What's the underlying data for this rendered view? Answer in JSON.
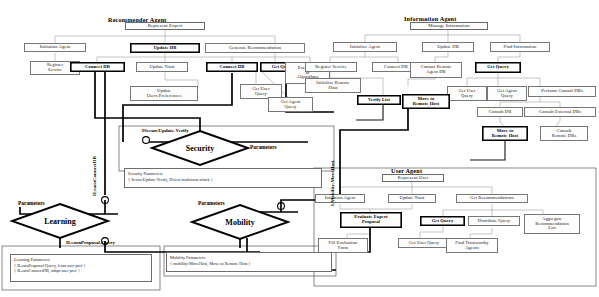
{
  "diagram": {
    "agents": [
      {
        "id": "recommender",
        "title": "Recommender Agent",
        "root": "Represent Expert",
        "nodes": [
          {
            "id": "rec-init",
            "label": "Initiation Agent",
            "style": "plain"
          },
          {
            "id": "rec-reg",
            "label": "Register\nService",
            "style": "plain"
          },
          {
            "id": "rec-upd",
            "label": "Update DB",
            "style": "bold"
          },
          {
            "id": "rec-conn",
            "label": "Connect DB",
            "style": "bold"
          },
          {
            "id": "rec-trust",
            "label": "Update Trust",
            "style": "plain"
          },
          {
            "id": "rec-pref",
            "label": "Update\nUsers Preferences",
            "style": "plain"
          },
          {
            "id": "rec-gen",
            "label": "Generate Recommendation",
            "style": "plain"
          },
          {
            "id": "rec-conn2",
            "label": "Connect DB",
            "style": "bold"
          },
          {
            "id": "rec-getq",
            "label": "Get Query",
            "style": "bold"
          },
          {
            "id": "rec-exec",
            "label": "Execution\nof\nAlgorithms",
            "style": "plain"
          },
          {
            "id": "rec-guq",
            "label": "Get User\nQuery",
            "style": "plain"
          },
          {
            "id": "rec-gaq",
            "label": "Get Agent\nQuery",
            "style": "plain"
          }
        ]
      },
      {
        "id": "information",
        "title": "Information Agent",
        "root": "Manage Information",
        "nodes": [
          {
            "id": "inf-init",
            "label": "Initialize Agent",
            "style": "plain"
          },
          {
            "id": "inf-reg",
            "label": "Register Service",
            "style": "plain"
          },
          {
            "id": "inf-conn",
            "label": "Connect DB",
            "style": "plain"
          },
          {
            "id": "inf-upd",
            "label": "Update DB",
            "style": "plain"
          },
          {
            "id": "inf-crdb",
            "label": "Contact Remote\nAgent DB",
            "style": "plain"
          },
          {
            "id": "inf-find",
            "label": "Find Information",
            "style": "plain"
          },
          {
            "id": "inf-getq",
            "label": "Get Query",
            "style": "bold"
          },
          {
            "id": "inf-guq",
            "label": "Get User\nQuery",
            "style": "plain"
          },
          {
            "id": "inf-gaq",
            "label": "Get Agent\nQuery",
            "style": "plain"
          },
          {
            "id": "inf-pcdb",
            "label": "Perform Consult DBs",
            "style": "plain"
          },
          {
            "id": "inf-cdb",
            "label": "Consult DB",
            "style": "plain"
          },
          {
            "id": "inf-cedb",
            "label": "Consult External DBs",
            "style": "plain"
          },
          {
            "id": "inf-crdbs",
            "label": "Consult\nRemote DBs",
            "style": "plain"
          },
          {
            "id": "inf-ver",
            "label": "Verify List",
            "style": "bold"
          },
          {
            "id": "inf-move1",
            "label": "Move to\nRemote Host",
            "style": "bold"
          },
          {
            "id": "inf-move2",
            "label": "Move to\nRemote Host",
            "style": "bold"
          },
          {
            "id": "inf-irh",
            "label": "Initialize Remote\nHost",
            "style": "plain"
          }
        ]
      },
      {
        "id": "user",
        "title": "User Agent",
        "root": "Represent User",
        "nodes": [
          {
            "id": "usr-init",
            "label": "Initiation Agent",
            "style": "plain"
          },
          {
            "id": "usr-eval",
            "label": "Evaluate Expert\nProposal",
            "style": "bold"
          },
          {
            "id": "usr-fill",
            "label": "Fill Evaluation\nForm",
            "style": "plain"
          },
          {
            "id": "usr-trust",
            "label": "Update Trust",
            "style": "plain"
          },
          {
            "id": "usr-getq",
            "label": "Get Query",
            "style": "bold"
          },
          {
            "id": "usr-guq",
            "label": "Get User Query",
            "style": "plain"
          },
          {
            "id": "usr-grec",
            "label": "Get Recommendations",
            "style": "plain"
          },
          {
            "id": "usr-dist",
            "label": "Distribute Query",
            "style": "plain"
          },
          {
            "id": "usr-find",
            "label": "Find Trustworthy\nAgents",
            "style": "plain"
          },
          {
            "id": "usr-agg",
            "label": "Aggregate\nRecommendation\nList",
            "style": "plain"
          }
        ]
      }
    ],
    "aspects": [
      {
        "id": "security",
        "name": "Security",
        "pointcut_label": "ISecureUpdate-Verify",
        "parameters_label": "Parameters",
        "note_title": "Security Parameters",
        "note_lines": [
          "{ SecureUpdate-Verify, Detect malicious attack }"
        ]
      },
      {
        "id": "learning",
        "name": "Learning",
        "pointcut_label": "ILearnProposal-Query",
        "vertical_label": "ILearnConnectDB",
        "parameters_label": "Parameters",
        "note_title": "Learning Parameters",
        "note_lines": [
          "{ ILearnProposal-Query, learn user pref }",
          "{ ILearnConnectDB, adapt user pref }"
        ]
      },
      {
        "id": "mobility",
        "name": "Mobility",
        "vertical_label": "I:Mobility:MoveHost",
        "parameters_label": "Parameters",
        "note_title": "Mobility Parameters",
        "note_lines": [
          "{ mobility:MoveHost, Move to Remote Host }"
        ]
      }
    ]
  }
}
